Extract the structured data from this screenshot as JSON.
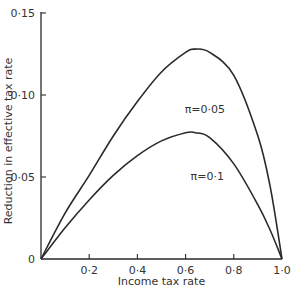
{
  "chart_data": {
    "type": "line",
    "title": "",
    "xlabel": "Income tax rate",
    "ylabel": "Reduction in effective tax rate",
    "xlim": [
      0,
      1.0
    ],
    "ylim": [
      0,
      0.15
    ],
    "x_ticks": [
      {
        "value": 0.2,
        "label": "0·2"
      },
      {
        "value": 0.4,
        "label": "0·4"
      },
      {
        "value": 0.6,
        "label": "0·6"
      },
      {
        "value": 0.8,
        "label": "0·8"
      },
      {
        "value": 1.0,
        "label": "1·0"
      }
    ],
    "y_ticks": [
      {
        "value": 0,
        "label": "0"
      },
      {
        "value": 0.05,
        "label": "0·05"
      },
      {
        "value": 0.1,
        "label": "0·10"
      },
      {
        "value": 0.15,
        "label": "0·15"
      }
    ],
    "grid": false,
    "legend": "none (curves labeled inline)",
    "x": [
      0,
      0.1,
      0.2,
      0.3,
      0.4,
      0.5,
      0.6,
      0.64,
      0.7,
      0.8,
      0.9,
      0.95,
      1.0
    ],
    "series": [
      {
        "name": "π=0·05",
        "label": "π=0·05",
        "values": [
          0,
          0.028,
          0.051,
          0.075,
          0.096,
          0.114,
          0.126,
          0.128,
          0.126,
          0.112,
          0.075,
          0.045,
          0
        ]
      },
      {
        "name": "π=0·1",
        "label": "π=0·1",
        "values": [
          0,
          0.019,
          0.036,
          0.051,
          0.063,
          0.072,
          0.077,
          0.077,
          0.074,
          0.058,
          0.033,
          0.018,
          0
        ]
      }
    ],
    "annotations": [
      {
        "text": "π=0·05",
        "x": 0.68,
        "y": 0.089
      },
      {
        "text": "π=0·1",
        "x": 0.69,
        "y": 0.048
      }
    ]
  }
}
